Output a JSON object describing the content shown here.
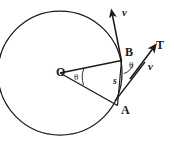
{
  "figure": {
    "canvas": {
      "width": 174,
      "height": 143,
      "background": "#ffffff"
    },
    "stroke_color": "#1a1a1a",
    "labels": {
      "center": "O",
      "point_upper": "B",
      "point_lower": "A",
      "chord": "s",
      "tension": "T",
      "velocity_top": "v",
      "velocity_right": "v",
      "angle_center": "θ",
      "angle_at_b": "θ"
    },
    "geometry": {
      "circle_center_x": 60,
      "circle_center_y": 73,
      "circle_radius": 62,
      "point_b_x": 121,
      "point_b_y": 60,
      "point_a_x": 117,
      "point_a_y": 105,
      "center_angle_deg": 36,
      "inscribed_angle_deg": 18
    }
  }
}
